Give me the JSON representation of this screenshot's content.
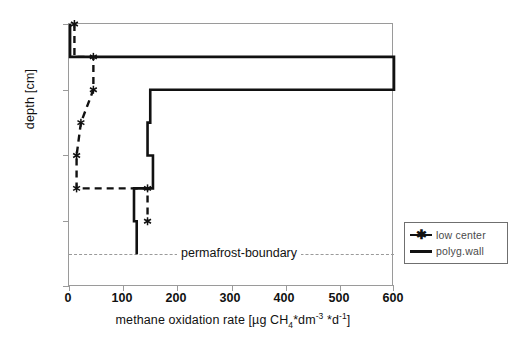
{
  "chart_data": {
    "type": "line",
    "title": "",
    "xlabel": "methane oxidation rate [µg CH4*dm-3 *d-1]",
    "ylabel": "depth [cm]",
    "xlim": [
      0,
      600
    ],
    "ylim": [
      40,
      0
    ],
    "y_inverted": true,
    "grid": false,
    "legend_position": "right-outside",
    "xticks": [
      "0",
      "100",
      "200",
      "300",
      "400",
      "500",
      "600"
    ],
    "xtick_values": [
      0,
      100,
      200,
      300,
      400,
      500,
      600
    ],
    "yticks": [
      "0",
      "10",
      "20",
      "30",
      "40"
    ],
    "ytick_values": [
      0,
      10,
      20,
      30,
      40
    ],
    "annotations": [
      {
        "label": "permafrost-boundary",
        "type": "horizontal-dashed-line",
        "depth_cm": 35
      }
    ],
    "series": [
      {
        "name": "low center",
        "style": "dashed",
        "marker": "asterisk",
        "color": "#111111",
        "points": [
          {
            "rate": 10,
            "depth": 0
          },
          {
            "rate": 10,
            "depth": 5
          },
          {
            "rate": 45,
            "depth": 5
          },
          {
            "rate": 45,
            "depth": 10
          },
          {
            "rate": 22,
            "depth": 15
          },
          {
            "rate": 14,
            "depth": 20
          },
          {
            "rate": 14,
            "depth": 25
          },
          {
            "rate": 145,
            "depth": 25
          },
          {
            "rate": 145,
            "depth": 30
          }
        ],
        "markers": [
          {
            "rate": 10,
            "depth": 0
          },
          {
            "rate": 45,
            "depth": 5
          },
          {
            "rate": 45,
            "depth": 10
          },
          {
            "rate": 22,
            "depth": 15
          },
          {
            "rate": 14,
            "depth": 20
          },
          {
            "rate": 14,
            "depth": 25
          },
          {
            "rate": 145,
            "depth": 25
          },
          {
            "rate": 145,
            "depth": 30
          }
        ]
      },
      {
        "name": "polyg.wall",
        "style": "solid",
        "marker": "none",
        "color": "#111111",
        "points": [
          {
            "rate": 2,
            "depth": 0
          },
          {
            "rate": 2,
            "depth": 5
          },
          {
            "rate": 600,
            "depth": 5
          },
          {
            "rate": 600,
            "depth": 10
          },
          {
            "rate": 150,
            "depth": 10
          },
          {
            "rate": 150,
            "depth": 15
          },
          {
            "rate": 145,
            "depth": 15
          },
          {
            "rate": 145,
            "depth": 20
          },
          {
            "rate": 155,
            "depth": 20
          },
          {
            "rate": 155,
            "depth": 25
          },
          {
            "rate": 120,
            "depth": 25
          },
          {
            "rate": 120,
            "depth": 30
          },
          {
            "rate": 125,
            "depth": 30
          },
          {
            "rate": 125,
            "depth": 35
          }
        ]
      }
    ]
  },
  "axes": {
    "ylabel": "depth [cm]",
    "xlabel_parts": {
      "pre": "methane oxidation rate [µg CH",
      "sub1": "4",
      "mid": "*dm",
      "sup1": "-3",
      "mid2": " *d",
      "sup2": "-1",
      "post": "]"
    },
    "xticks": [
      "0",
      "100",
      "200",
      "300",
      "400",
      "500",
      "600"
    ],
    "yticks": [
      "0",
      "10",
      "20",
      "30",
      "40"
    ]
  },
  "legend": {
    "items": [
      {
        "label": "low center",
        "style": "dashed-asterisk"
      },
      {
        "label": "polyg.wall",
        "style": "solid"
      }
    ]
  },
  "permafrost": {
    "label": "permafrost-boundary"
  },
  "colors": {
    "series": "#111111",
    "axis": "#9a9a9a",
    "permafrost": "#9a9a9a",
    "legend_text": "#4a4a4a"
  }
}
